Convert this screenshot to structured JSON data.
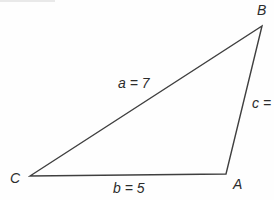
{
  "diagram": {
    "colors": {
      "background": "#fefefe",
      "line": "#3f3f3f",
      "text": "#2c2c2c"
    },
    "vertices": {
      "B": {
        "label": "B"
      },
      "C": {
        "label": "C"
      },
      "A": {
        "label": "A"
      }
    },
    "sides": {
      "a": {
        "label": "a = 7"
      },
      "b": {
        "label": "b = 5"
      },
      "c": {
        "label": "c ="
      }
    }
  }
}
